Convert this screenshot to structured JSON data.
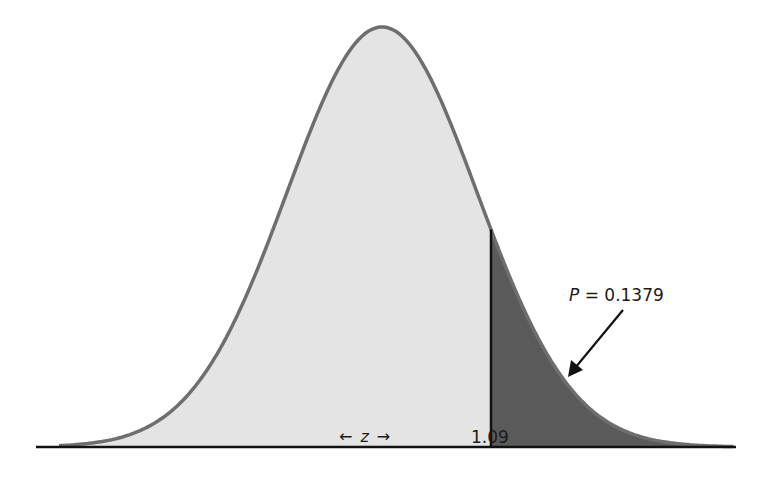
{
  "chart_data": {
    "type": "area",
    "title": "",
    "subtitle": "",
    "distribution": "normal",
    "mean": 0,
    "sd": 1,
    "xlabel": "z",
    "ylabel": "",
    "x_range": [
      -3.4,
      3.7
    ],
    "grid": false,
    "legend": null,
    "cutoff": 1.09,
    "shaded_region": {
      "from": 1.09,
      "to": "inf",
      "probability": 0.1379
    },
    "annotations": [
      {
        "text_var": "P",
        "text_eq": "= 0.1379",
        "points_to": "shaded upper tail"
      },
      {
        "text": "← z →",
        "position": "below axis"
      },
      {
        "text": "1.09",
        "position": "below cutoff line"
      }
    ],
    "colors": {
      "curve_fill": "#e4e4e4",
      "tail_fill": "#5a5a5a",
      "curve_stroke": "#6e6e6e",
      "axis": "#111111",
      "cutoff_line": "#111111"
    }
  },
  "labels": {
    "p_var": "P",
    "p_eq": "= 0.1379",
    "z_left_arrow": "←",
    "z_var": "z",
    "z_right_arrow": "→",
    "cutoff_value": "1.09"
  }
}
